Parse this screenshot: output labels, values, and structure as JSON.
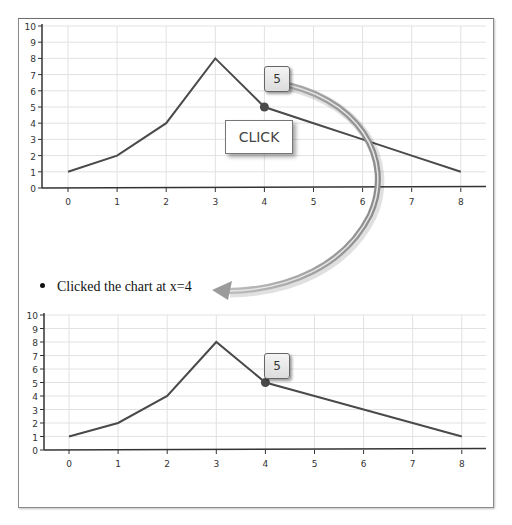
{
  "page": {
    "cut_off_caption": "... when the chart is clicked"
  },
  "annotation": {
    "click_label": "CLICK"
  },
  "output": {
    "list_item": "Clicked the chart at x=4"
  },
  "charts": {
    "top": {
      "tooltip_value": "5"
    },
    "bottom": {
      "tooltip_value": "5"
    }
  },
  "colors": {
    "line": "#4a4a4a",
    "grid": "#e2e2e2",
    "axis": "#333333",
    "marker": "#4a4a4a",
    "arrow": "#9a9a9a"
  },
  "chart_data": [
    {
      "type": "line",
      "title": "",
      "xlabel": "",
      "ylabel": "",
      "x": [
        0,
        1,
        2,
        3,
        4,
        5,
        6,
        7,
        8
      ],
      "series": [
        {
          "name": "series1",
          "values": [
            1,
            2,
            4,
            8,
            5,
            4,
            3,
            2,
            1
          ]
        }
      ],
      "xticks": [
        "0",
        "1",
        "2",
        "3",
        "4",
        "5",
        "6",
        "7",
        "8"
      ],
      "yticks": [
        "0",
        "1",
        "2",
        "3",
        "4",
        "5",
        "6",
        "7",
        "8",
        "9",
        "10"
      ],
      "xlim": [
        -0.5,
        8.5
      ],
      "ylim": [
        0,
        10
      ],
      "grid": true,
      "highlighted_point": {
        "x": 4,
        "y": 5,
        "tooltip": "5"
      },
      "annotations": [
        "CLICK"
      ]
    },
    {
      "type": "line",
      "title": "",
      "xlabel": "",
      "ylabel": "",
      "x": [
        0,
        1,
        2,
        3,
        4,
        5,
        6,
        7,
        8
      ],
      "series": [
        {
          "name": "series1",
          "values": [
            1,
            2,
            4,
            8,
            5,
            4,
            3,
            2,
            1
          ]
        }
      ],
      "xticks": [
        "0",
        "1",
        "2",
        "3",
        "4",
        "5",
        "6",
        "7",
        "8"
      ],
      "yticks": [
        "0",
        "1",
        "2",
        "3",
        "4",
        "5",
        "6",
        "7",
        "8",
        "9",
        "10"
      ],
      "xlim": [
        -0.5,
        8.5
      ],
      "ylim": [
        0,
        10
      ],
      "grid": true,
      "highlighted_point": {
        "x": 4,
        "y": 5,
        "tooltip": "5"
      }
    }
  ]
}
